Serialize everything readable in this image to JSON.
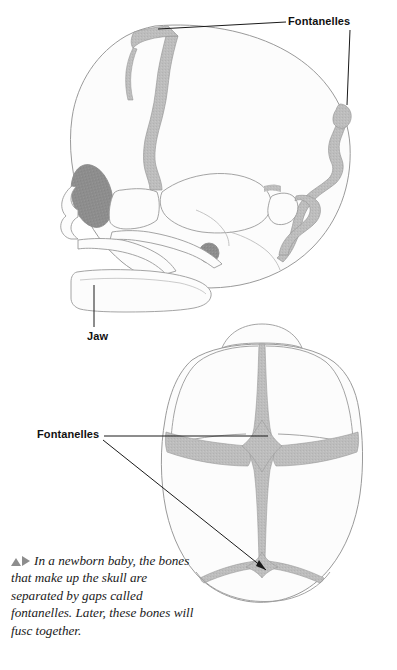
{
  "figure": {
    "colors": {
      "bone_fill": "#fcfcfc",
      "fontanelle_fill": "#b9b9b9",
      "outline": "#9a9a9a",
      "dark_feature": "#8a8a8a",
      "leader_line": "#1a1a1a",
      "label_text": "#111111",
      "caption_text": "#1a1a1a",
      "marker_gray": "#8d8d8d",
      "page_background": "#ffffff"
    }
  },
  "labels": {
    "fontanelles_top": "Fontanelles",
    "jaw": "Jaw",
    "fontanelles_middle": "Fontanelles"
  },
  "views": {
    "lateral": {
      "name": "lateral-skull-view",
      "features": [
        "anterior-fontanelle",
        "posterior-fontanelle",
        "coronal-suture",
        "squamous-suture",
        "eye-socket",
        "ear-canal",
        "maxilla",
        "mandible-jaw"
      ]
    },
    "superior": {
      "name": "superior-skull-view",
      "features": [
        "anterior-fontanelle",
        "posterior-fontanelle",
        "sagittal-suture",
        "coronal-suture",
        "lambdoid-suture",
        "frontal-bone-arc"
      ]
    }
  },
  "caption": {
    "marker_up": "triangle-up",
    "marker_right": "triangle-right",
    "text": "In a newborn baby, the bones that make up the skull are separated by gaps called fontanelles. Later, these bones will fusc together."
  }
}
